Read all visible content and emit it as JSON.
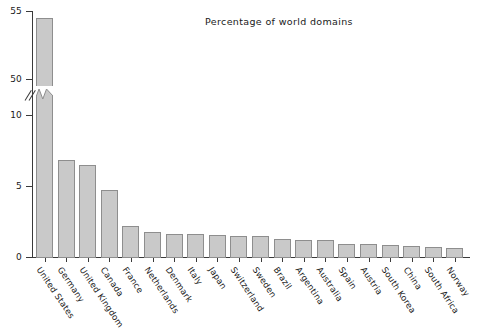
{
  "chart_data": {
    "type": "bar",
    "title": "Percentage of world domains",
    "xlabel": "",
    "ylabel": "",
    "grid": false,
    "legend": "none",
    "orientation": "vertical",
    "axis_break": {
      "present": true,
      "lower_range": [
        0,
        11
      ],
      "upper_range": [
        49,
        55
      ],
      "note": "y axis broken between 10 and 50"
    },
    "ytick_labels": [
      "0",
      "5",
      "10",
      "50",
      "55"
    ],
    "ytick_values": [
      0,
      5,
      10,
      50,
      55
    ],
    "categories": [
      "United States",
      "Germany",
      "United Kingdom",
      "Canada",
      "France",
      "Netherlands",
      "Denmark",
      "Italy",
      "Japan",
      "Switzerland",
      "Sweden",
      "Brazil",
      "Argentina",
      "Australia",
      "Spain",
      "Austria",
      "South Korea",
      "China",
      "South Africa",
      "Norway"
    ],
    "values": [
      54.5,
      6.8,
      6.5,
      4.75,
      2.2,
      1.75,
      1.65,
      1.6,
      1.55,
      1.5,
      1.45,
      1.3,
      1.2,
      1.2,
      0.95,
      0.9,
      0.85,
      0.8,
      0.7,
      0.6
    ],
    "colors": {
      "bar_fill": "#c9c9c9",
      "bar_stroke": "#8e8e8e",
      "axis": "#3a3a3a",
      "text": "#1a1a1a",
      "background": "#ffffff"
    }
  }
}
